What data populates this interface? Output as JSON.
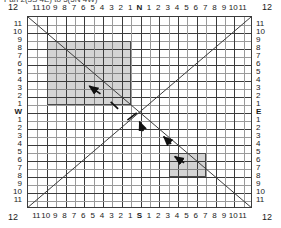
{
  "caption": {
    "text": "Pan 2(3S 4E) to 5(5N 4W)",
    "clipped": true
  },
  "diagram": {
    "name": "pan-tilt-grid",
    "type": "cartesian-compass-grid"
  },
  "axes": {
    "top": {
      "center_label": "N",
      "left_ticks": [
        "11",
        "10",
        "9",
        "8",
        "7",
        "6",
        "5",
        "4",
        "3",
        "2",
        "1"
      ],
      "right_ticks": [
        "1",
        "2",
        "3",
        "4",
        "5",
        "6",
        "7",
        "8",
        "9",
        "10",
        "11"
      ],
      "corner_left": "12",
      "corner_right": "12"
    },
    "bottom": {
      "center_label": "S",
      "left_ticks": [
        "11",
        "10",
        "9",
        "8",
        "7",
        "6",
        "5",
        "4",
        "3",
        "2",
        "1"
      ],
      "right_ticks": [
        "1",
        "2",
        "3",
        "4",
        "5",
        "6",
        "7",
        "8",
        "9",
        "10",
        "11"
      ],
      "corner_left": "12",
      "corner_right": "12"
    },
    "left": {
      "center_label": "W",
      "upper_ticks": [
        "11",
        "10",
        "9",
        "8",
        "7",
        "6",
        "5",
        "4",
        "3",
        "2",
        "1"
      ],
      "lower_ticks": [
        "1",
        "2",
        "3",
        "4",
        "5",
        "6",
        "7",
        "8",
        "9",
        "10",
        "11"
      ],
      "corner_top": "12",
      "corner_bottom": "12"
    },
    "right": {
      "center_label": "E",
      "upper_ticks": [
        "11",
        "10",
        "9",
        "8",
        "7",
        "6",
        "5",
        "4",
        "3",
        "2",
        "1"
      ],
      "lower_ticks": [
        "1",
        "2",
        "3",
        "4",
        "5",
        "6",
        "7",
        "8",
        "9",
        "10",
        "11"
      ],
      "corner_top": "12",
      "corner_bottom": "12"
    }
  },
  "grid": {
    "columns": 24,
    "rows": 24,
    "minor_color": "#9a9a9a",
    "major_color": "#3b3b3b",
    "major_every": 2,
    "frame_color": "#3b3b3b"
  },
  "regions": [
    {
      "id": "nw-region",
      "label": "north-west-shaded-region",
      "x_from": -10,
      "x_to": -1,
      "y_from": 9,
      "y_to": 1,
      "fill": "#c8c8c8",
      "stroke": "#4a4a4a"
    },
    {
      "id": "se-region",
      "label": "south-east-shaded-region",
      "x_from": 3,
      "x_to": 7,
      "y_from": -5,
      "y_to": -8,
      "fill": "#c8c8c8",
      "stroke": "#4a4a4a"
    }
  ],
  "diagonals": [
    {
      "id": "nw-se-diagonal",
      "from": "top-left",
      "to": "bottom-right",
      "color": "#3b3b3b"
    },
    {
      "id": "sw-ne-diagonal",
      "from": "bottom-left",
      "to": "top-right",
      "color": "#3b3b3b"
    }
  ],
  "arrows": [
    {
      "id": "arrow-nw-inner",
      "direction": "north-west",
      "note": "points up-left inside NW region"
    },
    {
      "id": "arrow-center-up",
      "direction": "north",
      "note": "short arrow below centre pointing up"
    },
    {
      "id": "arrow-se-upleft",
      "direction": "north-west",
      "note": "above SE region pointing up-left"
    },
    {
      "id": "arrow-se-inner",
      "direction": "north-west",
      "note": "inside SE region pointing up-left"
    }
  ],
  "markers": [
    {
      "id": "tick-marker-center-left",
      "note": "short slash crossing the NE-SW diagonal left of centre"
    },
    {
      "id": "tick-marker-nw",
      "note": "short slash crossing the NW-SE diagonal"
    }
  ],
  "colors": {
    "background": "#ffffff",
    "ink": "#1a1a1a",
    "shade": "#c8c8c8"
  }
}
